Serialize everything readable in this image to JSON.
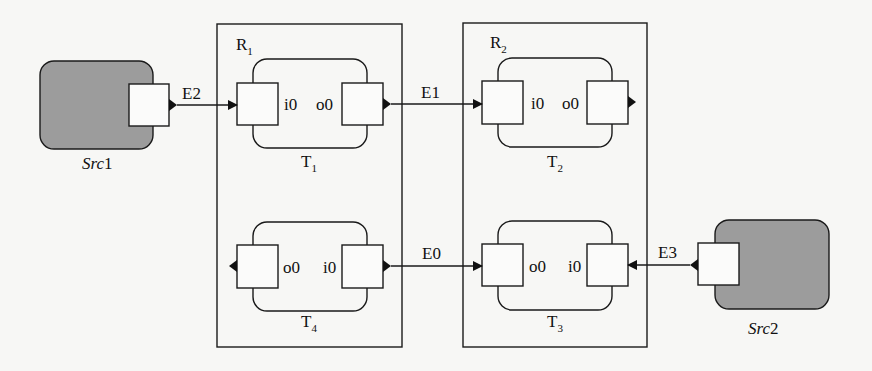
{
  "diagram": {
    "sources": [
      {
        "id": "src1",
        "name_italic": "Src",
        "name_num": "1",
        "fill": "#9c9c9c"
      },
      {
        "id": "src2",
        "name_italic": "Src",
        "name_num": "2",
        "fill": "#9c9c9c"
      }
    ],
    "regions": [
      {
        "id": "r1",
        "label": "R",
        "sub": "1"
      },
      {
        "id": "r2",
        "label": "R",
        "sub": "2"
      }
    ],
    "tasks": [
      {
        "id": "t1",
        "label": "T",
        "sub": "1",
        "left_port": "i0",
        "right_port": "o0"
      },
      {
        "id": "t2",
        "label": "T",
        "sub": "2",
        "left_port": "i0",
        "right_port": "o0"
      },
      {
        "id": "t3",
        "label": "T",
        "sub": "3",
        "left_port": "o0",
        "right_port": "i0"
      },
      {
        "id": "t4",
        "label": "T",
        "sub": "4",
        "left_port": "o0",
        "right_port": "i0"
      }
    ],
    "edges": [
      {
        "id": "e2",
        "label": "E2",
        "from": "Src1",
        "to": "T1.i0"
      },
      {
        "id": "e1",
        "label": "E1",
        "from": "T1.o0",
        "to": "T2.i0"
      },
      {
        "id": "e0",
        "label": "E0",
        "from": "T4.i0",
        "to": "T3.o0"
      },
      {
        "id": "e3",
        "label": "E3",
        "from": "Src2",
        "to": "T3.i0"
      }
    ]
  }
}
